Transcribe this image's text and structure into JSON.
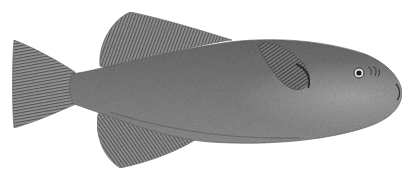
{
  "image": {
    "subject": "pufferfish engraving",
    "background": "#ffffff",
    "colors": {
      "body": "#7a7a7a",
      "body_dark": "#4e4e4e",
      "body_light": "#a8a8a8",
      "fin": "#8c8c8c",
      "fin_ray": "#555555",
      "eye": "#1e1e1e"
    }
  }
}
